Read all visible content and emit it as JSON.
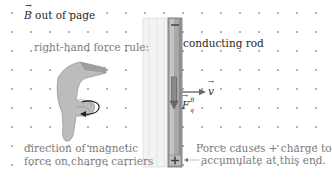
{
  "diagram": {
    "field_label": {
      "symbol": "B",
      "text": "out of page"
    },
    "rule_label": "right-hand force rule:",
    "rod_label": "conducting rod",
    "velocity_label": "v",
    "force_label": {
      "symbol": "F",
      "superscript": "B",
      "subscript": "q"
    },
    "hand_caption": [
      "direction of magnetic",
      "force on charge carriers"
    ],
    "charge_caption": [
      "Force causes + charge to",
      "accumulate at this end."
    ],
    "rod_top_sign": "−",
    "rod_bottom_sign": "+",
    "colors": {
      "dot": "#9a9a9a",
      "rod_fill": "#a8a8a8",
      "rod_edge": "#6f6f6f",
      "rail_fill": "#ececec",
      "hand_fill": "#b9b9b9",
      "text_dark": "#2a2a2a",
      "text_gray": "#7b7b7b",
      "arrow": "#5a5a5a"
    },
    "dot_grid": {
      "x0": 12,
      "y0": 13,
      "spacing": 19
    }
  }
}
